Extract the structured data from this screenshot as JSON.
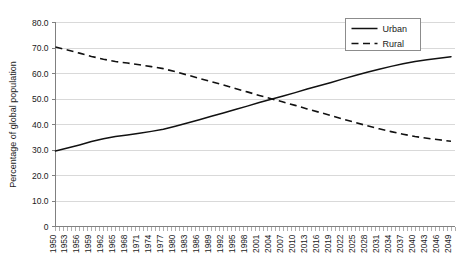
{
  "chart_data": {
    "type": "line",
    "title": "",
    "xlabel": "",
    "ylabel": "Percentage of global population",
    "ylim": [
      0,
      80
    ],
    "ytick_labels": [
      "0",
      "10.0",
      "20.0",
      "30.0",
      "40.0",
      "50.0",
      "60.0",
      "70.0",
      "80.0"
    ],
    "ytick_values": [
      0,
      10,
      20,
      30,
      40,
      50,
      60,
      70,
      80
    ],
    "grid": "horizontal",
    "legend_position": "top-right",
    "xlim": [
      1950,
      2050
    ],
    "xtick_labels": [
      "1950",
      "1953",
      "1956",
      "1959",
      "1962",
      "1965",
      "1968",
      "1971",
      "1974",
      "1977",
      "1980",
      "1983",
      "1986",
      "1989",
      "1992",
      "1995",
      "1998",
      "2001",
      "2004",
      "2007",
      "2010",
      "2013",
      "2016",
      "2019",
      "2022",
      "2025",
      "2028",
      "2031",
      "2034",
      "2037",
      "2040",
      "2043",
      "2046",
      "2049"
    ],
    "x_minor_tick_step": 1,
    "x": [
      1950,
      1953,
      1956,
      1959,
      1962,
      1965,
      1968,
      1971,
      1974,
      1977,
      1980,
      1983,
      1986,
      1989,
      1992,
      1995,
      1998,
      2001,
      2004,
      2007,
      2010,
      2013,
      2016,
      2019,
      2022,
      2025,
      2028,
      2031,
      2034,
      2037,
      2040,
      2043,
      2046,
      2049
    ],
    "series": [
      {
        "name": "Urban",
        "style": "solid",
        "color": "#111111",
        "values": [
          29.6,
          30.8,
          32.0,
          33.3,
          34.4,
          35.3,
          35.9,
          36.6,
          37.3,
          38.1,
          39.3,
          40.6,
          41.9,
          43.2,
          44.5,
          45.9,
          47.2,
          48.6,
          49.9,
          51.2,
          52.5,
          53.9,
          55.2,
          56.5,
          57.9,
          59.2,
          60.5,
          61.7,
          62.8,
          63.8,
          64.7,
          65.4,
          66.0,
          66.6
        ]
      },
      {
        "name": "Rural",
        "style": "dashed",
        "color": "#111111",
        "values": [
          70.4,
          69.2,
          68.0,
          66.7,
          65.6,
          64.7,
          64.1,
          63.4,
          62.7,
          61.9,
          60.7,
          59.4,
          58.1,
          56.8,
          55.5,
          54.1,
          52.8,
          51.4,
          50.1,
          48.8,
          47.5,
          46.1,
          44.8,
          43.5,
          42.1,
          40.8,
          39.5,
          38.3,
          37.2,
          36.2,
          35.3,
          34.6,
          34.0,
          33.4
        ]
      }
    ]
  },
  "legend": {
    "items": [
      {
        "label": "Urban",
        "style": "solid"
      },
      {
        "label": "Rural",
        "style": "dashed"
      }
    ]
  }
}
